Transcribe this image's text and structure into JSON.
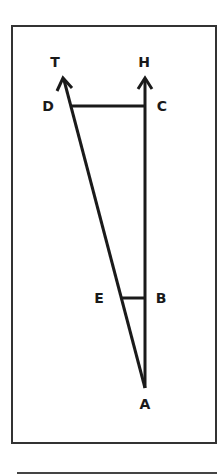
{
  "diagram": {
    "type": "geometry",
    "stroke_color": "#1a1a1a",
    "points": {
      "T": {
        "label": "T",
        "x": 55,
        "y": 67
      },
      "H": {
        "label": "H",
        "x": 144,
        "y": 67
      },
      "D": {
        "label": "D",
        "x": 48,
        "y": 111
      },
      "C": {
        "label": "C",
        "x": 162,
        "y": 111
      },
      "E": {
        "label": "E",
        "x": 99,
        "y": 303
      },
      "B": {
        "label": "B",
        "x": 161,
        "y": 303
      },
      "A": {
        "label": "A",
        "x": 145,
        "y": 409
      }
    },
    "segments": [
      "AT (ray)",
      "AH (ray)",
      "DC",
      "EB"
    ]
  }
}
